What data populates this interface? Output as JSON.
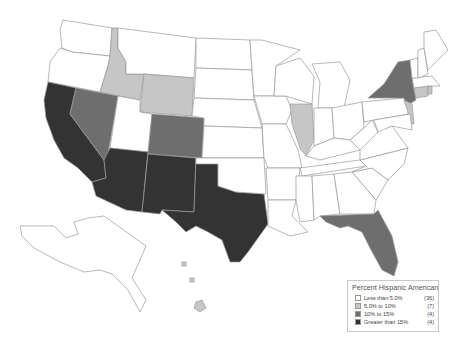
{
  "title": "Percent Hispanic American",
  "colors": {
    "less_than_5": "#ffffff",
    "5_to_10": "#c6c6c6",
    "10_to_15": "#6e6e6e",
    "greater_than_15": "#333333",
    "border": "#9a9a9a"
  },
  "legend": {
    "title": "Percent Hispanic American",
    "items": [
      {
        "label": "Less than 5.0%",
        "count": "(36)",
        "color": "#ffffff"
      },
      {
        "label": "5.0% to 10%",
        "count": "(7)",
        "color": "#c6c6c6"
      },
      {
        "label": "10%    to 15%",
        "count": "(4)",
        "color": "#6e6e6e"
      },
      {
        "label": "Greater than 15%",
        "count": "(4)",
        "color": "#333333"
      }
    ]
  },
  "map_data": {
    "greater_than_15": [
      "California",
      "Arizona",
      "New Mexico",
      "Texas"
    ],
    "10_to_15": [
      "Nevada",
      "Colorado",
      "New York",
      "Florida"
    ],
    "5_to_10": [
      "Idaho",
      "Wyoming",
      "Illinois",
      "Connecticut",
      "New Jersey",
      "Hawaii",
      "Rhode Island"
    ],
    "less_than_5_count": 36
  }
}
